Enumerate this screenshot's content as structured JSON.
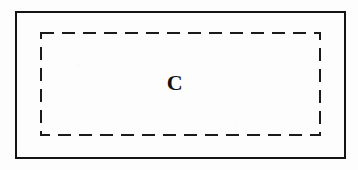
{
  "figure": {
    "type": "diagram",
    "background_color": "#fdfdfd",
    "width": 358,
    "height": 170,
    "outer_rectangle": {
      "name": "outer boundary rectangle",
      "stroke_style": "solid",
      "stroke_color": "#141414",
      "stroke_width": 2,
      "fill": "none",
      "x": 15,
      "y": 11,
      "width": 331,
      "height": 148
    },
    "inner_rectangle": {
      "name": "inner dashed region boundary",
      "stroke_style": "dashed",
      "stroke_color": "#1a1a1a",
      "stroke_width": 2,
      "dash_length": 13,
      "gap_length": 8,
      "fill": "none",
      "x": 41,
      "y": 33,
      "width": 279,
      "height": 102
    },
    "label": {
      "text": "C",
      "color": "#111111",
      "font_weight": "bold",
      "font_size": 22,
      "center_x": 175,
      "center_y": 84
    }
  }
}
